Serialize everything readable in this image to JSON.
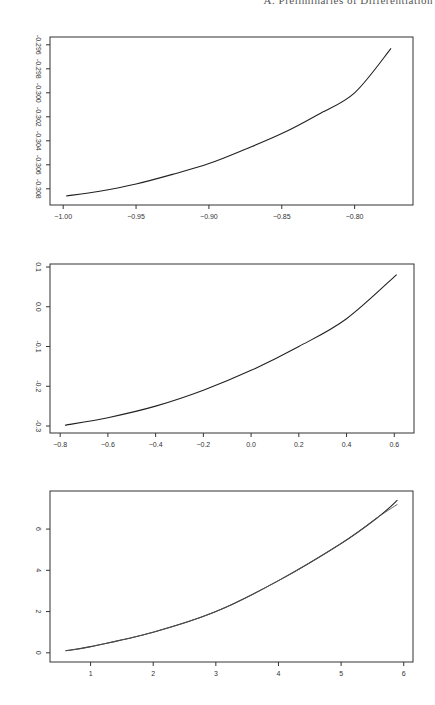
{
  "header": {
    "text": "A. Preliminaries of Differentiation"
  },
  "chart_data": [
    {
      "type": "line",
      "title": "",
      "xlabel": "",
      "ylabel": "",
      "xlim": [
        -1.007,
        -0.762
      ],
      "ylim": [
        -0.3091,
        -0.2956
      ],
      "xticks": [
        -1.0,
        -0.95,
        -0.9,
        -0.85,
        -0.8
      ],
      "xtick_labels": [
        "-1.00",
        "-0.95",
        "-0.90",
        "-0.85",
        "-0.80"
      ],
      "yticks": [
        -0.296,
        -0.298,
        -0.3,
        -0.302,
        -0.304,
        -0.306,
        -0.308
      ],
      "ytick_labels": [
        "-0.296",
        "-0.298",
        "-0.300",
        "-0.302",
        "-0.304",
        "-0.306",
        "-0.308"
      ],
      "grid": false,
      "legend": null,
      "series": [
        {
          "name": "curve",
          "x": [
            -0.998,
            -0.975,
            -0.95,
            -0.925,
            -0.9,
            -0.875,
            -0.85,
            -0.825,
            -0.8,
            -0.775
          ],
          "y": [
            -0.3086,
            -0.3082,
            -0.3076,
            -0.3068,
            -0.3059,
            -0.3047,
            -0.3034,
            -0.3018,
            -0.3,
            -0.2963
          ]
        }
      ]
    },
    {
      "type": "line",
      "title": "",
      "xlabel": "",
      "ylabel": "",
      "xlim": [
        -0.83,
        0.67
      ],
      "ylim": [
        -0.31,
        0.1
      ],
      "xticks": [
        -0.8,
        -0.6,
        -0.4,
        -0.2,
        0.0,
        0.2,
        0.4,
        0.6
      ],
      "xtick_labels": [
        "-0.8",
        "-0.6",
        "-0.4",
        "-0.2",
        "0.0",
        "0.2",
        "0.4",
        "0.6"
      ],
      "yticks": [
        0.1,
        0.0,
        -0.1,
        -0.2,
        -0.3
      ],
      "ytick_labels": [
        "0.1",
        "0.0",
        "-0.1",
        "-0.2",
        "-0.3"
      ],
      "grid": false,
      "legend": null,
      "series": [
        {
          "name": "curve",
          "x": [
            -0.78,
            -0.6,
            -0.4,
            -0.2,
            0.0,
            0.2,
            0.4,
            0.61
          ],
          "y": [
            -0.298,
            -0.279,
            -0.25,
            -0.21,
            -0.16,
            -0.1,
            -0.03,
            0.081
          ]
        }
      ]
    },
    {
      "type": "line",
      "title": "",
      "xlabel": "",
      "ylabel": "",
      "xlim": [
        0.4,
        6.1
      ],
      "ylim": [
        -0.3,
        7.7
      ],
      "xticks": [
        1,
        2,
        3,
        4,
        5,
        6
      ],
      "xtick_labels": [
        "1",
        "2",
        "3",
        "4",
        "5",
        "6"
      ],
      "yticks": [
        0,
        2,
        4,
        6
      ],
      "ytick_labels": [
        "0",
        "2",
        "4",
        "6"
      ],
      "grid": false,
      "legend": null,
      "series": [
        {
          "name": "curve-a",
          "x": [
            0.6,
            1.0,
            2.0,
            3.0,
            4.0,
            5.0,
            5.6,
            5.9
          ],
          "y": [
            0.1,
            0.3,
            1.0,
            2.0,
            3.5,
            5.3,
            6.6,
            7.4
          ]
        },
        {
          "name": "curve-b",
          "x": [
            0.6,
            1.0,
            2.0,
            3.0,
            4.0,
            5.0,
            5.6,
            5.9
          ],
          "y": [
            0.1,
            0.3,
            1.0,
            2.0,
            3.5,
            5.3,
            6.6,
            7.2
          ]
        }
      ]
    }
  ],
  "layout": {
    "charts": [
      {
        "top": 37,
        "left": 50,
        "width": 363,
        "height": 168,
        "xpx": [
          61,
          365
        ],
        "ypx": [
          42,
          190
        ]
      },
      {
        "top": 264,
        "left": 50,
        "width": 364,
        "height": 169
      },
      {
        "top": 491,
        "left": 50,
        "width": 363,
        "height": 171
      }
    ]
  }
}
